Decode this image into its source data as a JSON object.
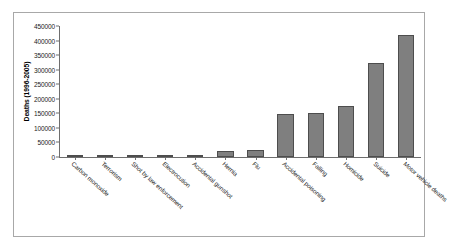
{
  "chart_data": {
    "type": "bar",
    "title": "",
    "xlabel": "",
    "ylabel": "Deaths (1996-2005)",
    "ylim": [
      0,
      450000
    ],
    "ytick_step": 50000,
    "grid": false,
    "legend": null,
    "bar_color": "#7f7f7f",
    "bar_edge_color": "#4d4d4d",
    "axis_color": "#6e6e6e",
    "frame_color": "#a8a8a8",
    "categories": [
      "Carbon monoxide",
      "Terrorism",
      "Shot by law enforcement",
      "Electrocution",
      "Accidental gunshot",
      "Hernia",
      "Flu",
      "Accidental poisoning",
      "Falling",
      "Homicide",
      "Suicide",
      "Motor vehicle deaths"
    ],
    "values": [
      2000,
      3000,
      3500,
      5000,
      8000,
      22000,
      24000,
      148000,
      152000,
      175000,
      322000,
      420000
    ],
    "ytick_labels": [
      "0",
      "50000",
      "100000",
      "150000",
      "200000",
      "250000",
      "300000",
      "350000",
      "400000",
      "450000"
    ],
    "ytick_values": [
      0,
      50000,
      100000,
      150000,
      200000,
      250000,
      300000,
      350000,
      400000,
      450000
    ]
  }
}
